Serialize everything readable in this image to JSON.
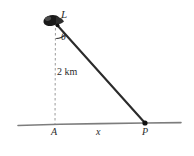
{
  "figure": {
    "type": "geometry-diagram",
    "background_color": "#ffffff",
    "width": 194,
    "height": 156,
    "labels": {
      "lighthouse": "L",
      "angle": "θ",
      "height": "2 km",
      "base_point": "A",
      "base_distance": "x",
      "ground_point": "P"
    },
    "colors": {
      "ink": "#2b2b2b",
      "ground_line": "#7d7d7d",
      "dashed_line": "#a0a0a0",
      "lamp_fill": "#1a1a1a",
      "ray_line": "#2b2b2b"
    },
    "geometry": {
      "lighthouse_point": [
        57,
        25
      ],
      "base_point": [
        55,
        124
      ],
      "ground_point": [
        145,
        123
      ],
      "ground_line_start": [
        18,
        125
      ],
      "ground_line_end": [
        181,
        123
      ],
      "vertical_height_km": 2,
      "horizontal_distance_label": "x",
      "angle_at_lighthouse": "θ"
    },
    "icons": {
      "lamp": "lighthouse-lamp-icon"
    }
  }
}
